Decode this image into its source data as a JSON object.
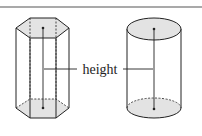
{
  "diagram": {
    "type": "geometry-solids",
    "shapes": [
      {
        "name": "hexagonal prism",
        "fill": "#e3e3e3"
      },
      {
        "name": "cylinder",
        "fill": "#e3e3e3"
      }
    ],
    "label": "height",
    "colors": {
      "stroke": "#222222",
      "face_fill": "#e3e3e3",
      "rule": "#555555"
    }
  }
}
